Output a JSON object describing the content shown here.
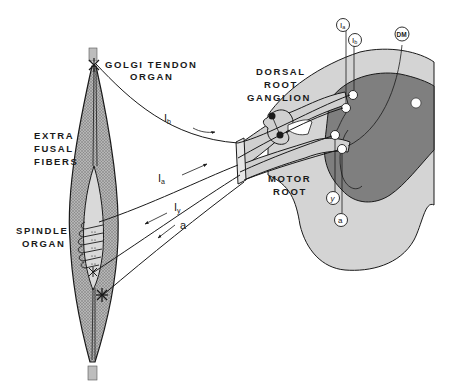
{
  "diagram": {
    "type": "anatomical-schematic",
    "colors": {
      "background": "#ffffff",
      "outline": "#1a1a1a",
      "muscle_fill": "#9a9a9a",
      "spindle_fill": "#d9d9d9",
      "white_matter": "#d4d4d4",
      "gray_matter": "#7f7f7f",
      "root_fill": "#d0d0d0"
    },
    "labels": {
      "golgi_line1": "GOLGI TENDON",
      "golgi_line2": "ORGAN",
      "extrafusal_line1": "EXTRA",
      "extrafusal_line2": "FUSAL",
      "extrafusal_line3": "FIBERS",
      "spindle_line1": "SPINDLE",
      "spindle_line2": "ORGAN",
      "dorsal_line1": "DORSAL",
      "dorsal_line2": "ROOT",
      "dorsal_line3": "GANGLION",
      "motor_line1": "MOTOR",
      "motor_line2": "ROOT"
    },
    "fibers": {
      "ib": {
        "main": "I",
        "sub": "b"
      },
      "ia": {
        "main": "I",
        "sub": "a"
      },
      "gamma": {
        "main": "I",
        "sub": "y"
      },
      "alpha": {
        "main": "a"
      }
    },
    "circled_labels": {
      "ia": {
        "main": "I",
        "sub": "a"
      },
      "ib": {
        "main": "I",
        "sub": "b"
      },
      "dm": {
        "main": "DM"
      },
      "gamma": {
        "main": "y"
      },
      "alpha": {
        "main": "a"
      }
    }
  }
}
